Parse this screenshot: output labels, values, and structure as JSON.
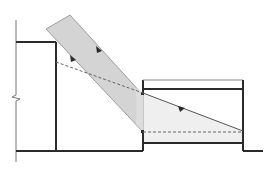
{
  "diagram": {
    "type": "architectural-section-daylight",
    "colors": {
      "background": "#ffffff",
      "line": "#2a2a2a",
      "thin_line": "#777777",
      "beam_fill": "#d4d4d4",
      "room_light_fill": "#efefef",
      "dashed": "#666666"
    },
    "elements": {
      "left_wall_line": "section cut line with break symbol",
      "left_building": "tall building volume",
      "right_building": "lower room with clerestory opening",
      "sun_beam": "parallel sun rays band",
      "direct_ray": "sun ray reaching floor",
      "shadow_line": "dashed boundary line",
      "floor_light_line": "dashed floor reference line"
    },
    "labels": []
  }
}
